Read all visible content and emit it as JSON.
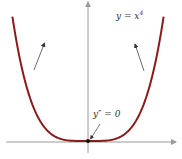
{
  "figure": {
    "function_label": "y = x",
    "function_exponent": "4",
    "inflection_label": "y″ = 0",
    "curve_color": "#8b1a1a",
    "axis_color": "#9a9a9a",
    "arrow_color": "#444444",
    "function": "x^4",
    "x_range": [
      -1.2,
      1.2
    ],
    "annotations": [
      {
        "text": "y″ = 0",
        "points_to": "origin"
      },
      {
        "type": "concave-up-arrow",
        "side": "left"
      },
      {
        "type": "concave-up-arrow",
        "side": "right"
      }
    ]
  }
}
